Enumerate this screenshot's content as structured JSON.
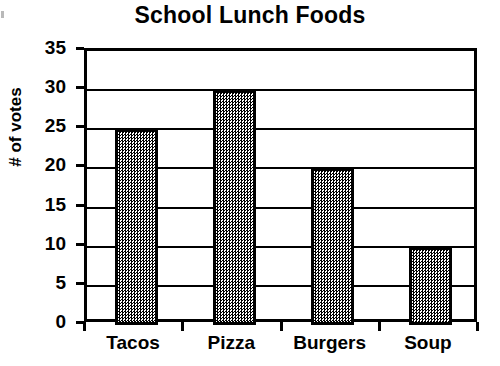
{
  "chart_data": {
    "type": "bar",
    "title": "School Lunch Foods",
    "xlabel": "",
    "ylabel": "# of votes",
    "categories": [
      "Tacos",
      "Pizza",
      "Burgers",
      "Soup"
    ],
    "values": [
      25,
      30,
      20,
      10
    ],
    "ylim": [
      0,
      35
    ],
    "ytick_labels": [
      "0",
      "5",
      "10",
      "15",
      "20",
      "25",
      "30",
      "35"
    ],
    "ytick_values": [
      0,
      5,
      10,
      15,
      20,
      25,
      30,
      35
    ],
    "grid": true,
    "legend": false,
    "bar_fill": "#808080",
    "bar_border": "#000000",
    "background": "#ffffff"
  }
}
